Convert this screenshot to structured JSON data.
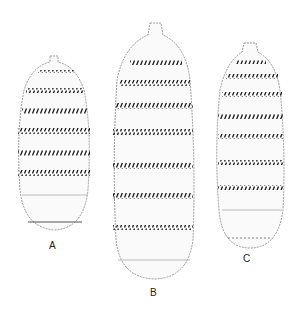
{
  "figure": {
    "specimens": [
      {
        "id": "A",
        "label": "A"
      },
      {
        "id": "B",
        "label": "B"
      },
      {
        "id": "C",
        "label": "C"
      }
    ],
    "colors": {
      "background": "#ffffff",
      "ink": "#1a1a1a",
      "outline": "#9a9a9a"
    }
  }
}
